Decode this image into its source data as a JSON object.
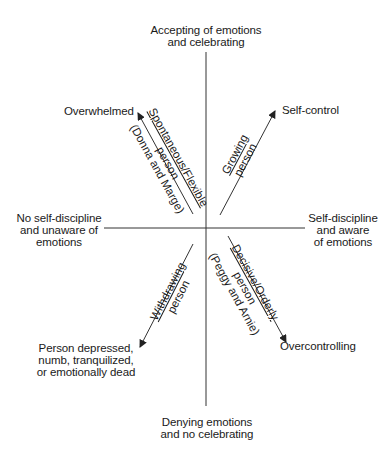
{
  "axes": {
    "top": [
      "Accepting of emotions",
      "and celebrating"
    ],
    "bottom": [
      "Denying emotions",
      "and no celebrating"
    ],
    "left": [
      "No self-discipline",
      "and unaware of",
      "emotions"
    ],
    "right": [
      "Self-discipline",
      "and aware",
      "of emotions"
    ]
  },
  "endpoints": {
    "upper_left": "Overwhelmed",
    "upper_right": "Self-control",
    "lower_left": [
      "Person depressed,",
      "numb, tranquilized,",
      "or emotionally dead"
    ],
    "lower_right": "Overcontrolling"
  },
  "arrows": {
    "upper_left": {
      "line1": "Spontaneous/Flexible",
      "line2": "person",
      "line3": "(Donna and Marge)"
    },
    "upper_right": {
      "line1": "Growing",
      "line2": "person"
    },
    "lower_left": {
      "line1": "Withdrawing",
      "line2": "person"
    },
    "lower_right": {
      "line1": "Decisive/Orderly",
      "line2": "person",
      "line3": "(Peggy and Arnie)"
    }
  },
  "colors": {
    "line": "#333333",
    "text": "#1a1a1a"
  }
}
